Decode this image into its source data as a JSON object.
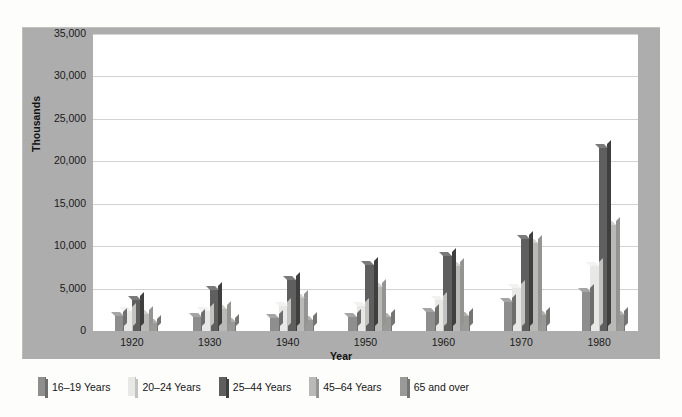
{
  "chart_data": {
    "type": "bar",
    "title": "",
    "xlabel": "Year",
    "ylabel": "Thousands",
    "ylim": [
      0,
      35000
    ],
    "ytick_step": 5000,
    "ytick_labels": [
      "0",
      "5,000",
      "10,000",
      "15,000",
      "20,000",
      "25,000",
      "30,000",
      "35,000"
    ],
    "ytick_values": [
      0,
      5000,
      10000,
      15000,
      20000,
      25000,
      30000,
      35000
    ],
    "grid": true,
    "legend_position": "bottom",
    "categories": [
      "1920",
      "1930",
      "1940",
      "1950",
      "1960",
      "1970",
      "1980"
    ],
    "series": [
      {
        "name": "16–19 Years",
        "color": "#8e8e8e",
        "side_color": "#6e6e6e",
        "top_color": "#a5a5a5",
        "values": [
          1800,
          1700,
          1500,
          1600,
          2200,
          3400,
          4600
        ]
      },
      {
        "name": "20–24 Years",
        "color": "#e8e8e6",
        "side_color": "#c2c2c0",
        "top_color": "#f2f2f0",
        "values": [
          2300,
          2400,
          2900,
          2900,
          3600,
          5100,
          7700
        ]
      },
      {
        "name": "25–44 Years",
        "color": "#5f5f5f",
        "side_color": "#3f3f3f",
        "top_color": "#7a7a7a",
        "values": [
          3700,
          4800,
          6000,
          7800,
          8800,
          10900,
          21600
        ]
      },
      {
        "name": "45–64 Years",
        "color": "#b9b9b7",
        "side_color": "#949492",
        "top_color": "#cfcfcd",
        "values": [
          2000,
          2600,
          3900,
          5200,
          7700,
          10400,
          12500
        ]
      },
      {
        "name": "65 and over",
        "color": "#999997",
        "side_color": "#757573",
        "top_color": "#b0b0ae",
        "values": [
          1000,
          1100,
          1300,
          1600,
          1800,
          1900,
          1900
        ]
      }
    ]
  },
  "legend": {
    "items": [
      "16–19 Years",
      "20–24 Years",
      "25–44 Years",
      "45–64 Years",
      "65 and over"
    ]
  }
}
